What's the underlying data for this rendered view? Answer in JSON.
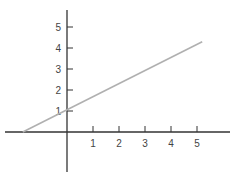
{
  "chart_data": {
    "type": "line",
    "title": "",
    "xlabel": "",
    "ylabel": "",
    "x_ticks": [
      "1",
      "2",
      "3",
      "4",
      "5"
    ],
    "y_ticks": [
      "1",
      "2",
      "3",
      "4",
      "5"
    ],
    "xlim": [
      -1.75,
      6.3
    ],
    "ylim": [
      -1.9,
      5.8
    ],
    "grid": false,
    "legend": null,
    "series": [
      {
        "name": "line",
        "color": "#b0b0b0",
        "x": [
          -1.7,
          5.2
        ],
        "y": [
          0.0,
          4.3
        ]
      }
    ],
    "axis_color": "#333333"
  }
}
